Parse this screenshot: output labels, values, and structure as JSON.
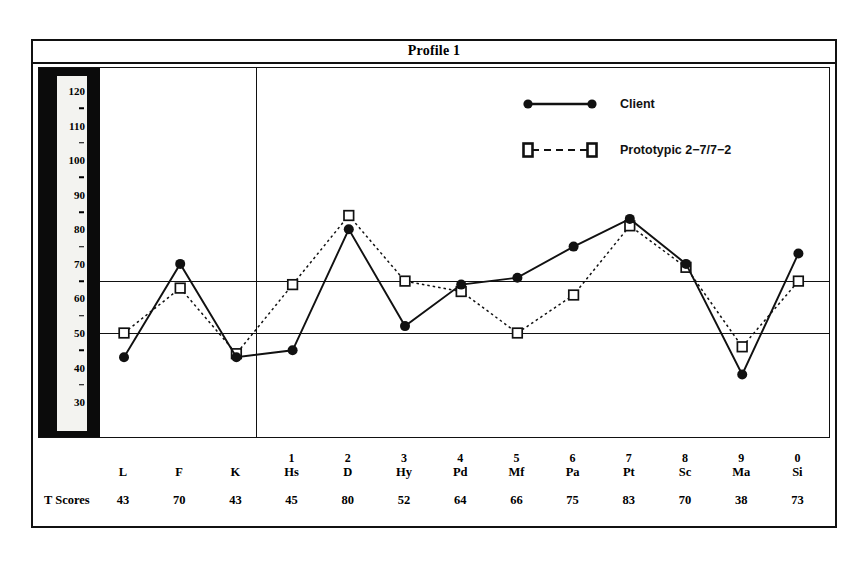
{
  "title": "Profile 1",
  "legend": {
    "client": {
      "label": "Client",
      "marker": "filled-circle",
      "line": "solid",
      "color": "#111111"
    },
    "prototypic": {
      "label": "Prototypic 2−7/7−2",
      "marker": "open-square",
      "line": "dashed",
      "color": "#111111"
    }
  },
  "table": {
    "tscores_caption": "T Scores"
  },
  "chart_data": {
    "type": "line",
    "title": "Profile 1",
    "xlabel": "",
    "ylabel": "T Score",
    "ylim": [
      30,
      125
    ],
    "grid": false,
    "legend_position": "top-right",
    "axis_tick_labels": [
      "120",
      "110",
      "100",
      "90",
      "80",
      "70",
      "60",
      "50",
      "40",
      "30"
    ],
    "axis_tick_values": [
      120,
      110,
      100,
      90,
      80,
      70,
      60,
      50,
      40,
      30
    ],
    "reference_lines": [
      65,
      50
    ],
    "section_divider_after": "K",
    "categories": [
      "L",
      "F",
      "K",
      "Hs",
      "D",
      "Hy",
      "Pd",
      "Mf",
      "Pa",
      "Pt",
      "Sc",
      "Ma",
      "Si"
    ],
    "category_numbers": [
      "",
      "",
      "",
      "1",
      "2",
      "3",
      "4",
      "5",
      "6",
      "7",
      "8",
      "9",
      "0"
    ],
    "series": [
      {
        "name": "Client",
        "marker": "filled-circle",
        "line": "solid",
        "values": [
          43,
          70,
          43,
          45,
          80,
          52,
          64,
          66,
          75,
          83,
          70,
          38,
          73
        ]
      },
      {
        "name": "Prototypic 2−7/7−2",
        "marker": "open-square",
        "line": "dashed",
        "values": [
          50,
          63,
          44,
          64,
          84,
          65,
          62,
          50,
          61,
          81,
          69,
          46,
          65
        ]
      }
    ]
  }
}
